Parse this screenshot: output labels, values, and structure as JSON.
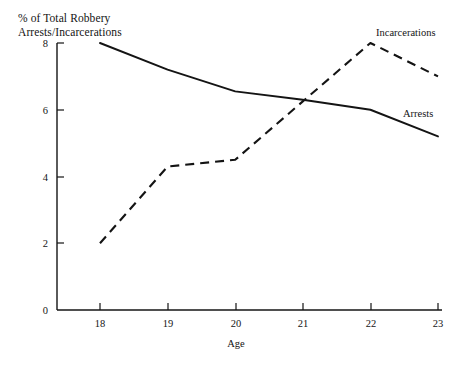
{
  "chart_data": {
    "type": "line",
    "title": "% of Total Robbery\nArrests/Incarcerations",
    "xlabel": "Age",
    "ylabel": "",
    "x": [
      18,
      19,
      20,
      21,
      22,
      23
    ],
    "xticklabels": [
      "18",
      "19",
      "20",
      "21",
      "22",
      "23"
    ],
    "yticks": [
      0,
      2,
      4,
      6,
      8
    ],
    "yticklabels": [
      "0",
      "2",
      "4",
      "6",
      "8"
    ],
    "xlim": [
      18,
      23
    ],
    "ylim": [
      0,
      8
    ],
    "grid": false,
    "legend": "inline-labels",
    "series": [
      {
        "name": "Arrests",
        "style": "solid",
        "color": "#141414",
        "values": [
          8.0,
          7.2,
          6.55,
          6.3,
          6.0,
          5.2
        ],
        "label_x": 21.9,
        "label_y": 5.9
      },
      {
        "name": "Incarcerations",
        "style": "dashed",
        "color": "#141414",
        "values": [
          2.0,
          4.3,
          4.5,
          6.25,
          8.0,
          7.0
        ],
        "label_x": 21.95,
        "label_y": 8.3
      }
    ]
  },
  "labels": {
    "arrests": "Arrests",
    "incarcerations": "Incarcerations",
    "x_axis_title": "Age",
    "title_line1": "% of Total Robbery",
    "title_line2": "Arrests/Incarcerations"
  },
  "axis": {
    "x_tick_18": "18",
    "x_tick_19": "19",
    "x_tick_20": "20",
    "x_tick_21": "21",
    "x_tick_22": "22",
    "x_tick_23": "23",
    "y_tick_0": "0",
    "y_tick_2": "2",
    "y_tick_4": "4",
    "y_tick_6": "6",
    "y_tick_8": "8"
  },
  "colors": {
    "ink": "#141414",
    "background": "#ffffff"
  }
}
